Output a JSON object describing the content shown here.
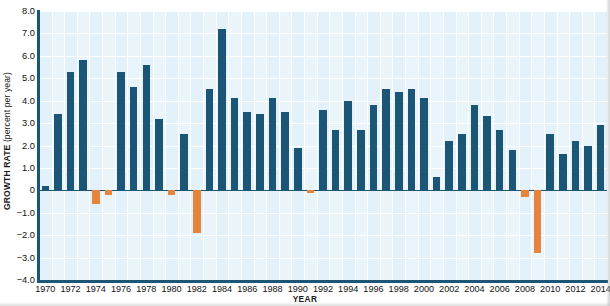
{
  "chart_data": {
    "type": "bar",
    "title": "",
    "xlabel": "YEAR",
    "ylabel": "GROWTH RATE (percent per year)",
    "ylabel_main": "GROWTH RATE",
    "ylabel_units": "(percent per year)",
    "ylim": [
      -4.0,
      8.0
    ],
    "ytick_labels": [
      "8.0",
      "7.0",
      "6.0",
      "5.0",
      "4.0",
      "3.0",
      "2.0",
      "1.0",
      "0",
      "−1.0",
      "−2.0",
      "−3.0",
      "−4.0"
    ],
    "ytick_values": [
      8,
      7,
      6,
      5,
      4,
      3,
      2,
      1,
      0,
      -1,
      -2,
      -3,
      -4
    ],
    "grid": true,
    "legend": "none",
    "xtick_labels": [
      "1970",
      "1972",
      "1974",
      "1976",
      "1978",
      "1980",
      "1982",
      "1984",
      "1986",
      "1988",
      "1990",
      "1992",
      "1994",
      "1996",
      "1998",
      "2000",
      "2002",
      "2004",
      "2006",
      "2008",
      "2010",
      "2012",
      "2014"
    ],
    "categories": [
      "1970",
      "1971",
      "1972",
      "1973",
      "1974",
      "1975",
      "1976",
      "1977",
      "1978",
      "1979",
      "1980",
      "1981",
      "1982",
      "1983",
      "1984",
      "1985",
      "1986",
      "1987",
      "1988",
      "1989",
      "1990",
      "1991",
      "1992",
      "1993",
      "1994",
      "1995",
      "1996",
      "1997",
      "1998",
      "1999",
      "2000",
      "2001",
      "2002",
      "2003",
      "2004",
      "2005",
      "2006",
      "2007",
      "2008",
      "2009",
      "2010",
      "2011",
      "2012",
      "2013",
      "2014"
    ],
    "values": [
      0.2,
      3.4,
      5.3,
      5.8,
      -0.6,
      -0.2,
      5.3,
      4.6,
      5.6,
      3.2,
      -0.2,
      2.5,
      -1.9,
      4.5,
      7.2,
      4.1,
      3.5,
      3.4,
      4.1,
      3.5,
      1.9,
      -0.1,
      3.6,
      2.7,
      4.0,
      2.7,
      3.8,
      4.5,
      4.4,
      4.5,
      4.1,
      0.6,
      2.2,
      2.5,
      3.8,
      3.3,
      2.7,
      1.8,
      -0.3,
      -2.8,
      2.5,
      1.6,
      2.2,
      2.0,
      2.9
    ],
    "colors": {
      "positive": "#1b5676",
      "negative": "#e5843c",
      "plot_background": "#e9f4fb",
      "axis": "#1c5575",
      "gridline": "#ffffff"
    }
  }
}
